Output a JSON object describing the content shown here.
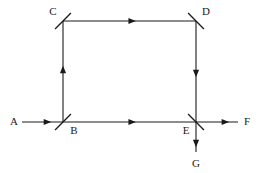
{
  "diagram": {
    "type": "optical-beam-path",
    "colors": {
      "background": "#ffffff",
      "line": "#1a1a1a",
      "label": "#1a1a1a"
    },
    "canvas": {
      "width": 259,
      "height": 173
    },
    "geometry": {
      "left_x": 63,
      "right_x": 196,
      "top_y": 21,
      "bottom_y": 122,
      "input_start_x": 22,
      "output_end_x": 238,
      "output_end_y": 152,
      "optic_half_length": 11
    },
    "nodes": [
      {
        "id": "A",
        "label": "A",
        "kind": "input-port",
        "label_x": 14,
        "label_y": 122
      },
      {
        "id": "B",
        "label": "B",
        "kind": "beam-splitter",
        "x": 63,
        "y": 122,
        "tilt": "forward-slash",
        "label_x": 74,
        "label_y": 131
      },
      {
        "id": "C",
        "label": "C",
        "kind": "mirror",
        "x": 63,
        "y": 21,
        "tilt": "forward-slash",
        "label_x": 53,
        "label_y": 12
      },
      {
        "id": "D",
        "label": "D",
        "kind": "mirror",
        "x": 196,
        "y": 21,
        "tilt": "back-slash",
        "label_x": 206,
        "label_y": 12
      },
      {
        "id": "E",
        "label": "E",
        "kind": "beam-splitter",
        "x": 196,
        "y": 122,
        "tilt": "back-slash",
        "label_x": 186,
        "label_y": 131
      },
      {
        "id": "F",
        "label": "F",
        "kind": "output-port",
        "label_x": 247,
        "label_y": 122
      },
      {
        "id": "G",
        "label": "G",
        "kind": "output-port",
        "label_x": 196,
        "label_y": 164
      }
    ],
    "beams": [
      {
        "id": "A-to-B",
        "from": "A",
        "to": "B",
        "direction": "right",
        "x1": 22,
        "y1": 122,
        "x2": 63,
        "y2": 122,
        "arrow_at": 0.62
      },
      {
        "id": "B-to-C",
        "from": "B",
        "to": "C",
        "direction": "up",
        "x1": 63,
        "y1": 122,
        "x2": 63,
        "y2": 21,
        "arrow_at": 0.52
      },
      {
        "id": "C-to-D",
        "from": "C",
        "to": "D",
        "direction": "right",
        "x1": 63,
        "y1": 21,
        "x2": 196,
        "y2": 21,
        "arrow_at": 0.52
      },
      {
        "id": "D-to-E",
        "from": "D",
        "to": "E",
        "direction": "down",
        "x1": 196,
        "y1": 21,
        "x2": 196,
        "y2": 122,
        "arrow_at": 0.52
      },
      {
        "id": "B-to-E",
        "from": "B",
        "to": "E",
        "direction": "right",
        "x1": 63,
        "y1": 122,
        "x2": 196,
        "y2": 122,
        "arrow_at": 0.52
      },
      {
        "id": "E-to-F",
        "from": "E",
        "to": "F",
        "direction": "right",
        "x1": 196,
        "y1": 122,
        "x2": 238,
        "y2": 122,
        "arrow_at": 0.7
      },
      {
        "id": "E-to-G",
        "from": "E",
        "to": "G",
        "direction": "down",
        "x1": 196,
        "y1": 122,
        "x2": 196,
        "y2": 152,
        "arrow_at": 0.72
      }
    ]
  }
}
